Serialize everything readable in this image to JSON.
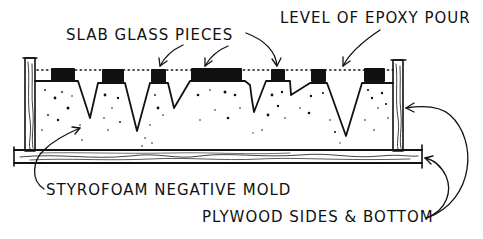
{
  "diagram": {
    "type": "cross-section sketch",
    "labels": {
      "slab_glass": "SLAB GLASS PIECES",
      "epoxy_level": "LEVEL OF EPOXY POUR",
      "styrofoam": "STYROFOAM NEGATIVE MOLD",
      "plywood": "PLYWOOD SIDES & BOTTOM"
    },
    "colors": {
      "ink": "#111111",
      "background": "#ffffff"
    }
  }
}
